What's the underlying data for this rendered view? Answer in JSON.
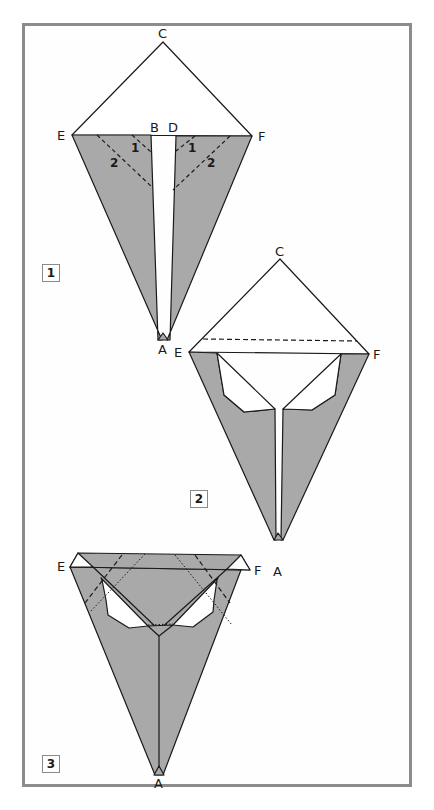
{
  "colors": {
    "paper": "#a9a9a9",
    "frame": "#8c8c8c",
    "line": "#1a1a1a",
    "background": "#ffffff"
  },
  "steps": [
    {
      "number": "1",
      "labels": {
        "C": "C",
        "E": "E",
        "B": "B",
        "D": "D",
        "F": "F",
        "A": "A"
      },
      "fold_numbers": [
        "1",
        "1",
        "2",
        "2"
      ]
    },
    {
      "number": "2",
      "labels": {
        "C": "C",
        "E": "E",
        "F": "F",
        "A": "A"
      }
    },
    {
      "number": "3",
      "labels": {
        "E": "E",
        "F": "F",
        "A": "A"
      }
    }
  ]
}
